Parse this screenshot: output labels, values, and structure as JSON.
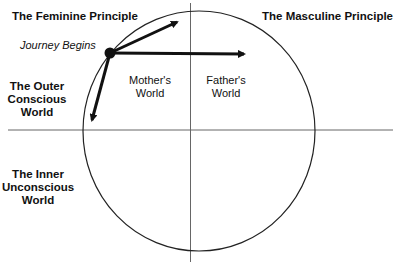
{
  "diagram": {
    "title_left": "The Feminine Principle",
    "title_right": "The Masculine Principle",
    "start_label": "Journey Begins",
    "outer_world": [
      "The Outer",
      "Conscious",
      "World"
    ],
    "inner_world": [
      "The Inner",
      "Unconscious",
      "World"
    ],
    "mothers_world": [
      "Mother's",
      "World"
    ],
    "fathers_world": [
      "Father's",
      "World"
    ]
  },
  "geometry": {
    "circle": {
      "cx": 199,
      "cy": 131,
      "rx": 116,
      "ry": 120
    },
    "horizontal_axis": {
      "x1": 8,
      "x2": 393,
      "y": 130
    },
    "vertical_axis": {
      "x": 190.5,
      "y1": 3,
      "y2": 262
    },
    "start_point": {
      "x": 110,
      "y": 53,
      "r": 5
    },
    "arrows": [
      {
        "name": "arrow-up-right",
        "x2": 181,
        "y2": 20
      },
      {
        "name": "arrow-right",
        "x2": 248,
        "y2": 54
      },
      {
        "name": "arrow-down-left",
        "x2": 91,
        "y2": 124
      }
    ]
  },
  "colors": {
    "line": "#222222",
    "axis": "#555555",
    "background": "#ffffff"
  }
}
